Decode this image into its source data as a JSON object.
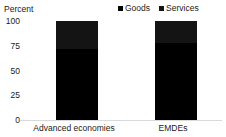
{
  "chart_data": {
    "type": "bar",
    "subtype": "stacked-vertical-100-percent",
    "title": "",
    "axis_title": "Percent",
    "xlabel": "",
    "ylabel": "Percent",
    "categories": [
      "Advanced economies",
      "EMDEs"
    ],
    "series": [
      {
        "name": "Goods",
        "values": [
          72,
          78
        ],
        "color": "#000000"
      },
      {
        "name": "Services",
        "values": [
          28,
          22
        ],
        "color": "#141414"
      }
    ],
    "ylim": [
      0,
      100
    ],
    "yticks": [
      100,
      75,
      50,
      25,
      0
    ],
    "ytick_labels": [
      "100",
      "75",
      "50",
      "25",
      "0"
    ],
    "grid": false,
    "legend_position": "top-right",
    "legend": [
      "Goods",
      "Services"
    ],
    "annotations": []
  },
  "legend": {
    "items": [
      {
        "label": "Goods",
        "color": "#000000",
        "icon": "square-marker-icon"
      },
      {
        "label": "Services",
        "color": "#141414",
        "icon": "square-marker-icon"
      }
    ]
  },
  "axis": {
    "title": "Percent",
    "ticks": [
      "100",
      "75",
      "50",
      "25",
      "0"
    ]
  },
  "categories": [
    {
      "label": "Advanced economies"
    },
    {
      "label": "EMDEs"
    }
  ]
}
